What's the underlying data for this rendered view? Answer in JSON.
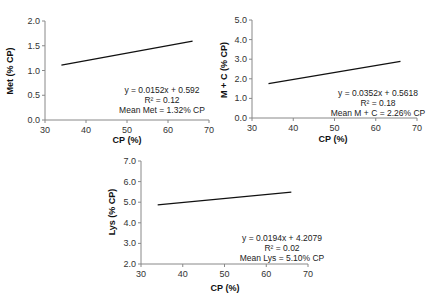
{
  "chart_data": [
    {
      "type": "scatter",
      "id": "met",
      "title": "",
      "xlabel": "CP (%)",
      "ylabel": "Met (% CP)",
      "xlim": [
        30,
        70
      ],
      "ylim": [
        0.0,
        2.0
      ],
      "xticks": [
        "30",
        "40",
        "50",
        "60",
        "70"
      ],
      "yticks": [
        "0.0",
        "0.5",
        "1.0",
        "1.5",
        "2.0"
      ],
      "grid": false,
      "legend": null,
      "marker_color": "#7f7f7f",
      "trendline": {
        "slope": 0.0152,
        "intercept": 0.592,
        "x_range": [
          34,
          66
        ]
      },
      "annotations": [
        "y = 0.0152x + 0.592",
        "R² = 0.12",
        "Mean Met = 1.32% CP"
      ],
      "equation": "y = 0.0152x + 0.592",
      "r2": 0.12,
      "mean": "Mean Met = 1.32% CP",
      "point_cloud": {
        "n_points": 1500,
        "x_range": [
          34,
          66
        ],
        "description": "dense cloud approx. y 0.75-1.95, rising with x",
        "outliers": [
          [
            34,
            1.2
          ],
          [
            36,
            1.33
          ],
          [
            51,
            0.72
          ],
          [
            55,
            0.66
          ],
          [
            60,
            1.02
          ],
          [
            62,
            0.97
          ],
          [
            65,
            1.8
          ],
          [
            66,
            1.45
          ]
        ]
      }
    },
    {
      "type": "scatter",
      "id": "mc",
      "title": "",
      "xlabel": "CP (%)",
      "ylabel": "M + C (% CP)",
      "xlim": [
        30,
        70
      ],
      "ylim": [
        0.0,
        5.0
      ],
      "xticks": [
        "30",
        "40",
        "50",
        "60",
        "70"
      ],
      "yticks": [
        "0.0",
        "1.0",
        "2.0",
        "3.0",
        "4.0",
        "5.0"
      ],
      "grid": false,
      "legend": null,
      "marker_color": "#7f7f7f",
      "trendline": {
        "slope": 0.0352,
        "intercept": 0.5618,
        "x_range": [
          34,
          66
        ]
      },
      "annotations": [
        "y = 0.0352x + 0.5618",
        "R² = 0.18",
        "Mean M + C = 2.26% CP"
      ],
      "equation": "y = 0.0352x + 0.5618",
      "r2": 0.18,
      "mean": "Mean M + C = 2.26% CP",
      "point_cloud": {
        "n_points": 1500,
        "x_range": [
          34,
          66
        ],
        "description": "dense cloud approx. y 1.2-4.3, rising with x",
        "outliers": [
          [
            34,
            2.0
          ],
          [
            40,
            3.1
          ],
          [
            48,
            3.9
          ],
          [
            53,
            4.3
          ],
          [
            58,
            4.2
          ],
          [
            64,
            3.85
          ],
          [
            65,
            3.1
          ],
          [
            66,
            2.7
          ]
        ]
      }
    },
    {
      "type": "scatter",
      "id": "lys",
      "title": "",
      "xlabel": "CP (%)",
      "ylabel": "Lys (% CP)",
      "xlim": [
        30,
        70
      ],
      "ylim": [
        2.0,
        7.0
      ],
      "xticks": [
        "30",
        "40",
        "50",
        "60",
        "70"
      ],
      "yticks": [
        "2.0",
        "3.0",
        "4.0",
        "5.0",
        "6.0",
        "7.0"
      ],
      "grid": false,
      "legend": null,
      "marker_color": "#7f7f7f",
      "trendline": {
        "slope": 0.0194,
        "intercept": 4.2079,
        "x_range": [
          34,
          66
        ]
      },
      "annotations": [
        "y = 0.0194x + 4.2079",
        "R² = 0.02",
        "Mean Lys = 5.10% CP"
      ],
      "equation": "y = 0.0194x + 4.2079",
      "r2": 0.02,
      "mean": "Mean Lys = 5.10% CP",
      "point_cloud": {
        "n_points": 1500,
        "x_range": [
          34,
          66
        ],
        "description": "dense cloud approx. y 3.5-6.7, flat",
        "outliers": [
          [
            34,
            4.85
          ],
          [
            36,
            3.9
          ],
          [
            62,
            3.85
          ],
          [
            63,
            6.45
          ],
          [
            64,
            4.4
          ],
          [
            65,
            5.75
          ],
          [
            66,
            5.05
          ]
        ]
      }
    }
  ]
}
